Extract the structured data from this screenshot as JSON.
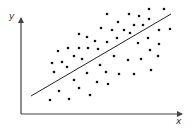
{
  "chart_data": {
    "type": "scatter",
    "title": "",
    "xlabel": "x",
    "ylabel": "y",
    "grid": false,
    "legend": null,
    "tick_labels": false,
    "points_px": [
      [
        149,
        9
      ],
      [
        164,
        9
      ],
      [
        107,
        14
      ],
      [
        129,
        14
      ],
      [
        139,
        16
      ],
      [
        149,
        19
      ],
      [
        118,
        22
      ],
      [
        134,
        25
      ],
      [
        143,
        25
      ],
      [
        101,
        28
      ],
      [
        112,
        30
      ],
      [
        124,
        30
      ],
      [
        130,
        33
      ],
      [
        159,
        30
      ],
      [
        170,
        29
      ],
      [
        79,
        34
      ],
      [
        87,
        37
      ],
      [
        95,
        41
      ],
      [
        107,
        42
      ],
      [
        117,
        38
      ],
      [
        148,
        38
      ],
      [
        58,
        51
      ],
      [
        68,
        48
      ],
      [
        79,
        48
      ],
      [
        88,
        48
      ],
      [
        98,
        49
      ],
      [
        138,
        43
      ],
      [
        150,
        50
      ],
      [
        159,
        44
      ],
      [
        52,
        63
      ],
      [
        62,
        62
      ],
      [
        74,
        56
      ],
      [
        82,
        59
      ],
      [
        67,
        67
      ],
      [
        114,
        56
      ],
      [
        54,
        72
      ],
      [
        100,
        65
      ],
      [
        106,
        72
      ],
      [
        87,
        73
      ],
      [
        119,
        74
      ],
      [
        128,
        60
      ],
      [
        141,
        59
      ],
      [
        158,
        56
      ],
      [
        151,
        70
      ],
      [
        134,
        74
      ],
      [
        74,
        80
      ],
      [
        97,
        82
      ],
      [
        108,
        84
      ],
      [
        79,
        88
      ],
      [
        59,
        91
      ],
      [
        50,
        100
      ],
      [
        69,
        99
      ],
      [
        90,
        95
      ]
    ],
    "trend_line_px": {
      "x1": 31,
      "y1": 96,
      "x2": 171,
      "y2": 14
    },
    "annotation": "positive linear correlation with fitted regression line"
  },
  "colors": {
    "axis": "#444444",
    "point": "#111111",
    "line": "#222222"
  }
}
